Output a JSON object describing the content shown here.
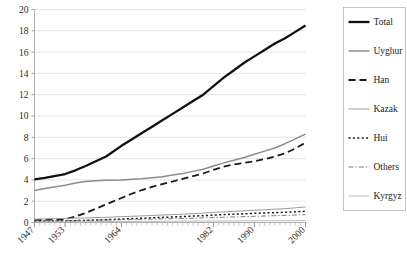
{
  "chart_data": {
    "type": "line",
    "title": "",
    "xlabel": "",
    "ylabel": "",
    "ylim": [
      0,
      20
    ],
    "ytick_labels": [
      "0",
      "2",
      "4",
      "6",
      "8",
      "10",
      "12",
      "14",
      "16",
      "18",
      "20"
    ],
    "ytick_values": [
      0,
      2,
      4,
      6,
      8,
      10,
      12,
      14,
      16,
      18,
      20
    ],
    "grid": true,
    "legend_position": "right",
    "x_tick_labels": [
      "1947",
      "1953",
      "1964",
      "1982",
      "1990",
      "2000"
    ],
    "x_tick_values": [
      1947,
      1953,
      1964,
      1982,
      1990,
      2000
    ],
    "x": [
      1947,
      1949,
      1953,
      1955,
      1957,
      1959,
      1961,
      1964,
      1966,
      1968,
      1970,
      1972,
      1974,
      1976,
      1978,
      1980,
      1982,
      1984,
      1986,
      1988,
      1990,
      1992,
      1994,
      1996,
      1998,
      2000
    ],
    "xlim": [
      1947,
      2000
    ],
    "series": [
      {
        "name": "Total",
        "color": "#111111",
        "width": 2.3,
        "dash": "none",
        "values": [
          4.05,
          4.2,
          4.55,
          4.9,
          5.3,
          5.75,
          6.2,
          7.2,
          7.8,
          8.4,
          9.0,
          9.6,
          10.2,
          10.8,
          11.4,
          12.0,
          12.8,
          13.6,
          14.3,
          15.0,
          15.6,
          16.2,
          16.8,
          17.3,
          17.9,
          18.5
        ]
      },
      {
        "name": "Uyghur",
        "color": "#8c8c8c",
        "width": 1.5,
        "dash": "none",
        "values": [
          3.0,
          3.2,
          3.5,
          3.7,
          3.85,
          3.92,
          3.96,
          4.0,
          4.05,
          4.1,
          4.2,
          4.3,
          4.45,
          4.6,
          4.8,
          5.0,
          5.3,
          5.6,
          5.85,
          6.1,
          6.4,
          6.7,
          7.0,
          7.4,
          7.85,
          8.3
        ]
      },
      {
        "name": "Han",
        "color": "#1a1a1a",
        "width": 1.8,
        "dash": "7,4",
        "values": [
          0.22,
          0.25,
          0.3,
          0.55,
          0.9,
          1.3,
          1.7,
          2.3,
          2.7,
          3.05,
          3.35,
          3.6,
          3.85,
          4.1,
          4.35,
          4.6,
          4.95,
          5.25,
          5.45,
          5.6,
          5.75,
          5.95,
          6.2,
          6.5,
          6.95,
          7.5
        ]
      },
      {
        "name": "Kazak",
        "color": "#9c9c9c",
        "width": 1.0,
        "dash": "none",
        "values": [
          0.32,
          0.34,
          0.38,
          0.4,
          0.43,
          0.46,
          0.49,
          0.55,
          0.58,
          0.62,
          0.66,
          0.7,
          0.74,
          0.78,
          0.83,
          0.88,
          0.95,
          1.0,
          1.05,
          1.1,
          1.15,
          1.2,
          1.25,
          1.3,
          1.38,
          1.45
        ]
      },
      {
        "name": "Hui",
        "color": "#141414",
        "width": 1.5,
        "dash": "2,2.4",
        "values": [
          0.12,
          0.13,
          0.15,
          0.17,
          0.2,
          0.23,
          0.26,
          0.32,
          0.36,
          0.4,
          0.44,
          0.48,
          0.52,
          0.56,
          0.6,
          0.64,
          0.7,
          0.74,
          0.78,
          0.82,
          0.86,
          0.9,
          0.93,
          0.96,
          1.0,
          1.05
        ]
      },
      {
        "name": "Others",
        "color": "#6e6e6e",
        "width": 0.9,
        "dash": "5,2,1.3,2",
        "values": [
          0.16,
          0.17,
          0.18,
          0.19,
          0.2,
          0.22,
          0.23,
          0.26,
          0.28,
          0.3,
          0.32,
          0.34,
          0.36,
          0.38,
          0.4,
          0.43,
          0.46,
          0.49,
          0.52,
          0.55,
          0.58,
          0.61,
          0.64,
          0.67,
          0.7,
          0.74
        ]
      },
      {
        "name": "Kyrgyz",
        "color": "#b3b3b3",
        "width": 0.9,
        "dash": "none",
        "values": [
          0.06,
          0.06,
          0.07,
          0.07,
          0.08,
          0.08,
          0.09,
          0.1,
          0.1,
          0.11,
          0.11,
          0.12,
          0.12,
          0.13,
          0.13,
          0.14,
          0.14,
          0.15,
          0.15,
          0.16,
          0.16,
          0.17,
          0.17,
          0.18,
          0.18,
          0.19
        ]
      }
    ]
  },
  "legend": {
    "items": [
      {
        "label": "Total"
      },
      {
        "label": "Uyghur"
      },
      {
        "label": "Han"
      },
      {
        "label": "Kazak"
      },
      {
        "label": "Hui"
      },
      {
        "label": "Others"
      },
      {
        "label": "Kyrgyz"
      }
    ]
  }
}
